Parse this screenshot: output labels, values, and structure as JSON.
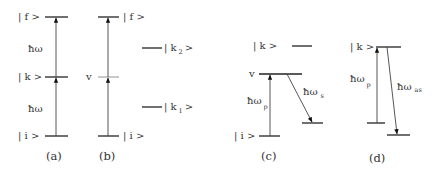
{
  "diagram": {
    "type": "energy-level-diagram",
    "panels": [
      {
        "caption": "(a)",
        "levels": [
          {
            "label": "| f >"
          },
          {
            "label": "| k >"
          },
          {
            "label": "| i >"
          }
        ],
        "transitions": [
          {
            "label": "ħω",
            "from": "| i >",
            "to": "| k >",
            "direction": "up"
          },
          {
            "label": "ħω",
            "from": "| k >",
            "to": "| f >",
            "direction": "up"
          }
        ]
      },
      {
        "caption": "(b)",
        "levels": [
          {
            "label": "| f >"
          },
          {
            "label": "v"
          },
          {
            "label": "| i >"
          },
          {
            "label": "| k 2 >",
            "main": "| k",
            "sub": "2",
            "close": ">"
          },
          {
            "label": "| k 1 >",
            "main": "| k",
            "sub": "1",
            "close": ">"
          }
        ],
        "transitions": [
          {
            "from": "| i >",
            "to": "v",
            "direction": "up"
          },
          {
            "from": "v",
            "to": "| f >",
            "direction": "up"
          }
        ]
      },
      {
        "caption": "(c)",
        "levels": [
          {
            "label": "| k >"
          },
          {
            "label": "v"
          },
          {
            "label": "| i >"
          }
        ],
        "transitions": [
          {
            "label": "ħω p",
            "main": "ħω",
            "sub": "p",
            "direction": "up"
          },
          {
            "label": "ħω s",
            "main": "ħω",
            "sub": "s",
            "direction": "down"
          }
        ]
      },
      {
        "caption": "(d)",
        "levels": [
          {
            "label": "| k >"
          }
        ],
        "transitions": [
          {
            "label": "ħω p",
            "main": "ħω",
            "sub": "p",
            "direction": "up"
          },
          {
            "label": "ħω as",
            "main": "ħω",
            "sub": "as",
            "direction": "down"
          }
        ]
      }
    ]
  }
}
